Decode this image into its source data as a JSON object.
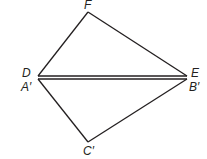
{
  "diagram": {
    "stroke_color": "#231f20",
    "background": "#ffffff",
    "points": {
      "F": {
        "label": "F",
        "x": 88,
        "y": 12
      },
      "D": {
        "label": "D",
        "x": 38,
        "y": 77
      },
      "E": {
        "label": "E",
        "x": 187,
        "y": 77
      },
      "C_prime": {
        "label": "C′",
        "x": 88,
        "y": 142
      }
    },
    "labels": {
      "F": "F",
      "D": "D",
      "A_prime": "A′",
      "E": "E",
      "B_prime": "B′",
      "C_prime": "C′"
    },
    "triangles": [
      {
        "name": "DEF",
        "vertices": [
          "D",
          "E",
          "F"
        ]
      },
      {
        "name": "A′B′C′",
        "vertices": [
          "A′",
          "B′",
          "C′"
        ]
      }
    ],
    "shared_side": "DE / A′B′ (drawn as double line)"
  }
}
